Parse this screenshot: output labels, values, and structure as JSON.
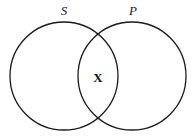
{
  "diagram": {
    "type": "venn",
    "sets": [
      {
        "label": "S",
        "cx": 64,
        "cy": 76,
        "r": 54
      },
      {
        "label": "P",
        "cx": 132,
        "cy": 76,
        "r": 54
      }
    ],
    "intersection_mark": "X",
    "stroke_color": "#1a1a1a",
    "background": "#ffffff"
  }
}
